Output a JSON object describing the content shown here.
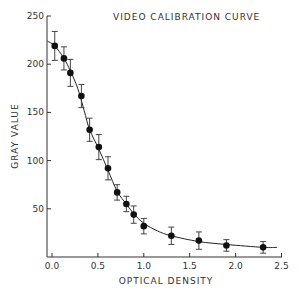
{
  "chart_data": {
    "type": "scatter",
    "title": "VIDEO CALIBRATION CURVE",
    "xlabel": "OPTICAL DENSITY",
    "ylabel": "GRAY VALUE",
    "xlim": [
      -0.05,
      2.5
    ],
    "ylim": [
      0,
      250
    ],
    "xticks": [
      0.0,
      0.5,
      1.0,
      1.5,
      2.0,
      2.5
    ],
    "xtick_labels": [
      "0.0",
      "0.5",
      "1.0",
      "1.5",
      "2.0",
      "2.5"
    ],
    "yticks": [
      50,
      100,
      150,
      200,
      250
    ],
    "ytick_labels": [
      "50",
      "100",
      "150",
      "200",
      "250"
    ],
    "grid": false,
    "legend": "none",
    "series": [
      {
        "name": "measured",
        "style": "points-with-error-bars",
        "x": [
          0.03,
          0.13,
          0.2,
          0.32,
          0.41,
          0.51,
          0.61,
          0.71,
          0.81,
          0.89,
          1.0,
          1.3,
          1.6,
          1.9,
          2.3
        ],
        "y": [
          219,
          206,
          191,
          167,
          132,
          114,
          92,
          67,
          55,
          44,
          32,
          22,
          17,
          12,
          10
        ],
        "error": [
          15,
          12,
          14,
          12,
          12,
          13,
          12,
          8,
          8,
          9,
          8,
          9,
          9,
          6,
          6
        ]
      },
      {
        "name": "fitted-curve",
        "style": "line",
        "x": [
          -0.05,
          0.03,
          0.13,
          0.2,
          0.28,
          0.35,
          0.41,
          0.51,
          0.61,
          0.71,
          0.81,
          0.89,
          1.0,
          1.15,
          1.3,
          1.6,
          1.9,
          2.3,
          2.45
        ],
        "y": [
          224,
          219,
          206,
          193,
          175,
          152,
          132,
          112,
          90,
          68,
          55,
          45,
          35,
          27,
          22,
          16,
          13,
          10,
          10
        ]
      }
    ]
  }
}
